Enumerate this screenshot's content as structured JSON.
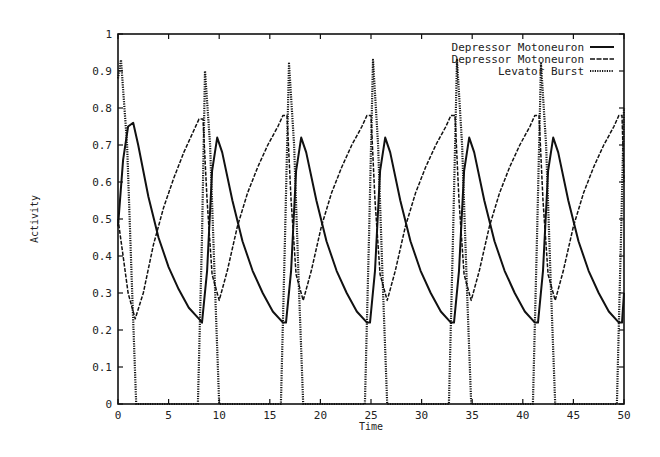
{
  "chart_data": {
    "type": "line",
    "title": "",
    "xlabel": "Time",
    "ylabel": "Activity",
    "xlim": [
      0,
      50
    ],
    "ylim": [
      0,
      1
    ],
    "xticks": [
      0,
      5,
      10,
      15,
      20,
      25,
      30,
      35,
      40,
      45,
      50
    ],
    "yticks": [
      0,
      0.1,
      0.2,
      0.3,
      0.4,
      0.5,
      0.6,
      0.7,
      0.8,
      0.9,
      1
    ],
    "xtick_labels": [
      "0",
      "5",
      "10",
      "15",
      "20",
      "25",
      "30",
      "35",
      "40",
      "45",
      "50"
    ],
    "ytick_labels": [
      "0",
      "0.1",
      "0.2",
      "0.3",
      "0.4",
      "0.5",
      "0.6",
      "0.7",
      "0.8",
      "0.9",
      "1"
    ],
    "grid": false,
    "legend_position": "top-right",
    "period": 8.3,
    "series": [
      {
        "name": "Depressor Motoneuron",
        "style": "solid",
        "x": [
          0,
          0.5,
          1.0,
          1.5,
          2.0,
          3.0,
          4.0,
          5.0,
          6.0,
          7.0,
          8.0,
          8.3,
          8.8,
          9.3,
          9.8,
          10.3,
          11.3,
          12.3,
          13.3,
          14.3,
          15.3,
          16.3,
          16.6,
          17.1,
          17.6,
          18.1,
          18.6,
          19.6,
          20.6,
          21.6,
          22.6,
          23.6,
          24.6,
          24.9,
          25.4,
          25.9,
          26.4,
          26.9,
          27.9,
          28.9,
          29.9,
          30.9,
          31.9,
          32.9,
          33.2,
          33.7,
          34.2,
          34.7,
          35.2,
          36.2,
          37.2,
          38.2,
          39.2,
          40.2,
          41.2,
          41.5,
          42.0,
          42.5,
          43.0,
          43.5,
          44.5,
          45.5,
          46.5,
          47.5,
          48.5,
          49.5,
          49.8,
          50
        ],
        "values": [
          0.48,
          0.66,
          0.75,
          0.76,
          0.7,
          0.56,
          0.45,
          0.37,
          0.31,
          0.26,
          0.23,
          0.22,
          0.36,
          0.63,
          0.72,
          0.68,
          0.55,
          0.44,
          0.36,
          0.3,
          0.25,
          0.22,
          0.22,
          0.36,
          0.63,
          0.72,
          0.68,
          0.55,
          0.44,
          0.36,
          0.3,
          0.25,
          0.22,
          0.22,
          0.36,
          0.63,
          0.72,
          0.68,
          0.55,
          0.44,
          0.36,
          0.3,
          0.25,
          0.22,
          0.22,
          0.36,
          0.63,
          0.72,
          0.68,
          0.55,
          0.44,
          0.36,
          0.3,
          0.25,
          0.22,
          0.22,
          0.36,
          0.63,
          0.72,
          0.68,
          0.55,
          0.44,
          0.36,
          0.3,
          0.25,
          0.22,
          0.22,
          0.3
        ]
      },
      {
        "name": "Depressor Motoneuron",
        "style": "dashed",
        "x": [
          0,
          0.5,
          1.0,
          1.7,
          2.5,
          3.5,
          4.5,
          5.5,
          6.5,
          7.5,
          8.0,
          8.4,
          8.8,
          9.3,
          10.0,
          10.8,
          11.8,
          12.8,
          13.8,
          14.8,
          15.8,
          16.3,
          16.7,
          17.1,
          17.6,
          18.3,
          19.1,
          20.1,
          21.1,
          22.1,
          23.1,
          24.1,
          24.6,
          25.0,
          25.4,
          25.9,
          26.6,
          27.4,
          28.4,
          29.4,
          30.4,
          31.4,
          32.4,
          32.9,
          33.3,
          33.7,
          34.2,
          34.9,
          35.7,
          36.7,
          37.7,
          38.7,
          39.7,
          40.7,
          41.2,
          41.6,
          42.0,
          42.5,
          43.2,
          44.0,
          45.0,
          46.0,
          47.0,
          48.0,
          49.0,
          49.5,
          49.8,
          50
        ],
        "values": [
          0.5,
          0.4,
          0.3,
          0.23,
          0.3,
          0.43,
          0.53,
          0.61,
          0.68,
          0.74,
          0.77,
          0.77,
          0.55,
          0.35,
          0.28,
          0.36,
          0.48,
          0.57,
          0.64,
          0.7,
          0.75,
          0.78,
          0.78,
          0.55,
          0.35,
          0.28,
          0.36,
          0.48,
          0.57,
          0.64,
          0.7,
          0.75,
          0.78,
          0.78,
          0.55,
          0.35,
          0.28,
          0.36,
          0.48,
          0.57,
          0.64,
          0.7,
          0.75,
          0.78,
          0.78,
          0.55,
          0.35,
          0.28,
          0.36,
          0.48,
          0.57,
          0.64,
          0.7,
          0.75,
          0.78,
          0.78,
          0.55,
          0.35,
          0.28,
          0.36,
          0.48,
          0.57,
          0.64,
          0.7,
          0.75,
          0.78,
          0.78,
          0.6
        ]
      },
      {
        "name": "Levator Burst",
        "style": "dotted",
        "x": [
          0,
          0.3,
          0.9,
          1.4,
          1.8,
          7.9,
          8.3,
          8.6,
          9.1,
          9.6,
          10.0,
          16.1,
          16.5,
          16.9,
          17.4,
          17.9,
          18.3,
          24.4,
          24.8,
          25.2,
          25.7,
          26.2,
          26.6,
          32.7,
          33.1,
          33.5,
          34.0,
          34.5,
          34.9,
          41.0,
          41.4,
          41.8,
          42.3,
          42.8,
          43.2,
          49.3,
          49.7,
          50
        ],
        "values": [
          0.88,
          0.93,
          0.7,
          0.3,
          0.0,
          0.0,
          0.45,
          0.9,
          0.7,
          0.3,
          0.0,
          0.0,
          0.45,
          0.92,
          0.7,
          0.3,
          0.0,
          0.0,
          0.45,
          0.93,
          0.7,
          0.3,
          0.0,
          0.0,
          0.45,
          0.93,
          0.7,
          0.3,
          0.0,
          0.0,
          0.45,
          0.92,
          0.7,
          0.3,
          0.0,
          0.0,
          0.45,
          0.8
        ]
      }
    ]
  },
  "legend": {
    "items": [
      {
        "label": "Depressor Motoneuron",
        "style": "solid"
      },
      {
        "label": "Depressor Motoneuron",
        "style": "dashed"
      },
      {
        "label": "Levator Burst",
        "style": "dotted"
      }
    ]
  },
  "plot_area": {
    "left": 118,
    "top": 34,
    "right": 624,
    "bottom": 404
  }
}
